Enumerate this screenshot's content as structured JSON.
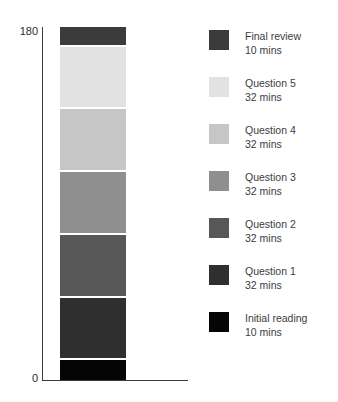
{
  "chart_data": {
    "type": "bar",
    "title": "",
    "xlabel": "",
    "ylabel": "",
    "ylim": [
      0,
      180
    ],
    "stacked": true,
    "orientation": "vertical",
    "grid": false,
    "legend_position": "right",
    "categories": [
      "Exam plan"
    ],
    "y_ticks": [
      "0",
      "180"
    ],
    "unit": "mins",
    "total": 180,
    "series": [
      {
        "name": "Final review",
        "values": [
          10
        ],
        "label": "Final review",
        "value_label": "10 mins",
        "color": "#3b3b3b"
      },
      {
        "name": "Question 5",
        "values": [
          32
        ],
        "label": "Question 5",
        "value_label": "32 mins",
        "color": "#e2e2e2"
      },
      {
        "name": "Question 4",
        "values": [
          32
        ],
        "label": "Question 4",
        "value_label": "32 mins",
        "color": "#c6c6c6"
      },
      {
        "name": "Question 3",
        "values": [
          32
        ],
        "label": "Question 3",
        "value_label": "32 mins",
        "color": "#8f8f8f"
      },
      {
        "name": "Question 2",
        "values": [
          32
        ],
        "label": "Question 2",
        "value_label": "32 mins",
        "color": "#575757"
      },
      {
        "name": "Question 1",
        "values": [
          32
        ],
        "label": "Question 1",
        "value_label": "32 mins",
        "color": "#2f2f2f"
      },
      {
        "name": "Initial reading",
        "values": [
          10
        ],
        "label": "Initial reading",
        "value_label": "10 mins",
        "color": "#050505"
      }
    ]
  },
  "axis": {
    "y_top_label": "180",
    "y_zero_label": "0"
  }
}
